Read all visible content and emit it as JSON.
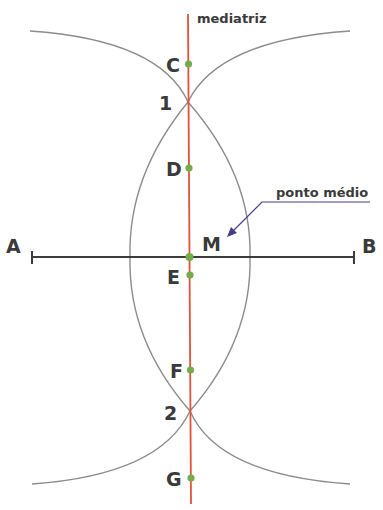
{
  "diagram": {
    "colors": {
      "arc": "#8c8c8c",
      "segment": "#3c3c3c",
      "mediatriz": "#e0533a",
      "point": "#72ad4a",
      "pointer": "#4a3a8a",
      "text": "#3a3a3a"
    },
    "segment": {
      "start_label": "A",
      "end_label": "B",
      "start": [
        32,
        257
      ],
      "end": [
        354,
        257
      ]
    },
    "mediatriz": {
      "label": "mediatriz",
      "from": [
        188,
        14
      ],
      "to": [
        191,
        504
      ]
    },
    "intersections": [
      {
        "label": "1",
        "pos": [
          188,
          102
        ]
      },
      {
        "label": "2",
        "pos": [
          190,
          411
        ]
      }
    ],
    "points": [
      {
        "label": "C",
        "pos": [
          188,
          64
        ]
      },
      {
        "label": "D",
        "pos": [
          189,
          168
        ]
      },
      {
        "label": "M",
        "pos": [
          189,
          257
        ]
      },
      {
        "label": "E",
        "pos": [
          190,
          275
        ]
      },
      {
        "label": "F",
        "pos": [
          190,
          370
        ]
      },
      {
        "label": "G",
        "pos": [
          191,
          478
        ]
      }
    ],
    "annotation": {
      "label": "ponto médio",
      "target": "M"
    },
    "text": {
      "A": "A",
      "B": "B",
      "C": "C",
      "D": "D",
      "E": "E",
      "F": "F",
      "G": "G",
      "M": "M",
      "one": "1",
      "two": "2",
      "mediatriz": "mediatriz",
      "ponto_medio": "ponto médio"
    }
  }
}
